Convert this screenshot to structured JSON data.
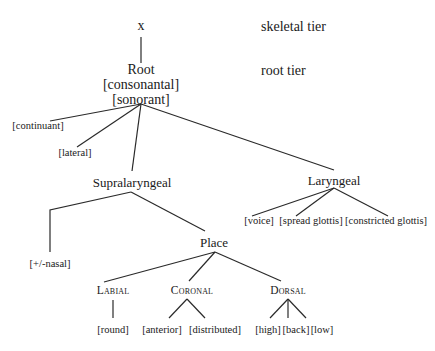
{
  "diagram": {
    "type": "feature-geometry-tree",
    "tiers": {
      "skeletal": "skeletal tier",
      "root": "root tier"
    },
    "nodes": {
      "skeletal_x": "x",
      "root": "Root",
      "root_feature_1": "[consonantal]",
      "root_feature_2": "[sonorant]",
      "continuant": "[continuant]",
      "lateral": "[lateral]",
      "supralaryngeal": "Supralaryngeal",
      "laryngeal": "Laryngeal",
      "voice": "[voice]",
      "spread_glottis": "[spread glottis]",
      "constricted_glottis": "[constricted glottis]",
      "nasal": "[+/-nasal]",
      "place": "Place",
      "labial": "Labial",
      "coronal": "Coronal",
      "dorsal": "Dorsal",
      "round": "[round]",
      "anterior": "[anterior]",
      "distributed": "[distributed]",
      "high": "[high]",
      "back": "[back]",
      "low": "[low]"
    },
    "edges": [
      [
        "x",
        "Root"
      ],
      [
        "Root",
        "[continuant]"
      ],
      [
        "Root",
        "[lateral]"
      ],
      [
        "Root",
        "Supralaryngeal"
      ],
      [
        "Root",
        "Laryngeal"
      ],
      [
        "Laryngeal",
        "[voice]"
      ],
      [
        "Laryngeal",
        "[spread glottis]"
      ],
      [
        "Laryngeal",
        "[constricted glottis]"
      ],
      [
        "Supralaryngeal",
        "[+/-nasal]"
      ],
      [
        "Supralaryngeal",
        "Place"
      ],
      [
        "Place",
        "Labial"
      ],
      [
        "Place",
        "Coronal"
      ],
      [
        "Place",
        "Dorsal"
      ],
      [
        "Labial",
        "[round]"
      ],
      [
        "Coronal",
        "[anterior]"
      ],
      [
        "Coronal",
        "[distributed]"
      ],
      [
        "Dorsal",
        "[high]"
      ],
      [
        "Dorsal",
        "[back]"
      ],
      [
        "Dorsal",
        "[low]"
      ]
    ],
    "line_color": "#2a2a2a",
    "text_color": "#1a1a1a"
  }
}
